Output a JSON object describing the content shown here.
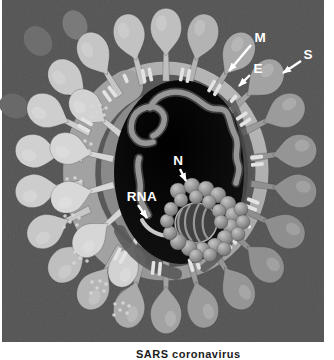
{
  "page": {
    "background": "#ffffff",
    "caption": "SARS coronavirus"
  },
  "figure": {
    "name": "coronavirus-cutaway-illustration",
    "labels": {
      "m": "M",
      "e": "E",
      "s": "S",
      "n": "N",
      "rna": "RNA"
    },
    "colors": {
      "photo_background": "#474747",
      "interior_cavity": "#0d0d0d",
      "envelope_band": "#a9a9a9",
      "spike_light": "#cfcfcf",
      "spike_mid": "#a0a0a0",
      "spike_dark": "#8e8e8e",
      "nucleocapsid_bead": "#9a9a9a",
      "label_text": "#ffffff",
      "caption_text": "#1c1c1c"
    }
  }
}
